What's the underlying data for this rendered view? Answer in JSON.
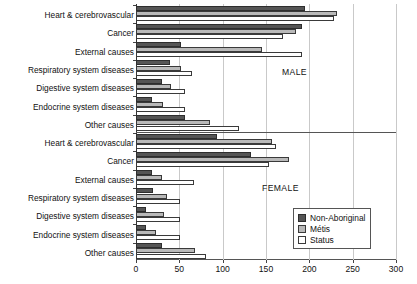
{
  "chart_data": {
    "type": "bar",
    "orientation": "horizontal",
    "title": "",
    "xlabel": "",
    "ylabel": "",
    "xlim": [
      0,
      300
    ],
    "xticks": [
      0,
      50,
      100,
      150,
      200,
      250,
      300
    ],
    "grid": true,
    "legend_position": "bottom-right",
    "legend_entries": [
      "Non-Aboriginal",
      "Métis",
      "Status"
    ],
    "panels": [
      {
        "name": "MALE",
        "categories": [
          "Heart & cerebrovascular",
          "Cancer",
          "External causes",
          "Respiratory system diseases",
          "Digestive system diseases",
          "Endocrine system diseases",
          "Other causes"
        ],
        "series": [
          {
            "name": "Non-Aboriginal",
            "values": [
              195,
              191,
              52,
              39,
              30,
              18,
              57
            ]
          },
          {
            "name": "Métis",
            "values": [
              232,
              185,
              145,
              52,
              40,
              31,
              85
            ]
          },
          {
            "name": "Status",
            "values": [
              228,
              170,
              192,
              65,
              56,
              56,
              119
            ]
          }
        ]
      },
      {
        "name": "FEMALE",
        "categories": [
          "Heart & cerebrovascular",
          "Cancer",
          "External causes",
          "Respiratory system diseases",
          "Digestive system diseases",
          "Endocrine system diseases",
          "Other causes"
        ],
        "series": [
          {
            "name": "Non-Aboriginal",
            "values": [
              94,
              133,
              18,
              20,
              12,
              12,
              30
            ]
          },
          {
            "name": "Métis",
            "values": [
              157,
              177,
              30,
              36,
              32,
              23,
              68
            ]
          },
          {
            "name": "Status",
            "values": [
              161,
              154,
              67,
              51,
              51,
              51,
              81
            ]
          }
        ]
      }
    ],
    "colors": {
      "non_aboriginal": "#555555",
      "metis": "#b9b9b9",
      "status": "#ffffff",
      "outline": "#3a3a3a",
      "grid": "#c9c9c9",
      "axis": "#444444"
    }
  }
}
